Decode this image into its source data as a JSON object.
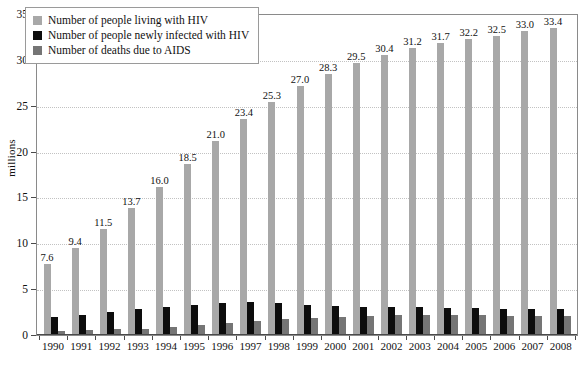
{
  "chart_data": {
    "type": "bar",
    "title": "",
    "subtitle": "",
    "xlabel": "",
    "ylabel": "millions",
    "ylim": [
      0,
      35
    ],
    "ytick_step": 5,
    "yticks": [
      "0",
      "5",
      "10",
      "15",
      "20",
      "25",
      "30",
      "35"
    ],
    "grid": true,
    "legend_position": "top-left-inside",
    "categories": [
      "1990",
      "1991",
      "1992",
      "1993",
      "1994",
      "1995",
      "1996",
      "1997",
      "1998",
      "1999",
      "2000",
      "2001",
      "2002",
      "2003",
      "2004",
      "2005",
      "2006",
      "2007",
      "2008"
    ],
    "series": [
      {
        "name": "Number of people living with HIV",
        "color": "#a8a8a8",
        "show_labels": true,
        "values": [
          7.6,
          9.4,
          11.5,
          13.7,
          16.0,
          18.5,
          21.0,
          23.4,
          25.3,
          27.0,
          28.3,
          29.5,
          30.4,
          31.2,
          31.7,
          32.2,
          32.5,
          33.0,
          33.4
        ],
        "labels": [
          "7.6",
          "9.4",
          "11.5",
          "13.7",
          "16.0",
          "18.5",
          "21.0",
          "23.4",
          "25.3",
          "27.0",
          "28.3",
          "29.5",
          "30.4",
          "31.2",
          "31.7",
          "32.2",
          "32.5",
          "33.0",
          "33.4"
        ]
      },
      {
        "name": "Number of people newly infected with HIV",
        "color": "#0d0d0d",
        "show_labels": false,
        "values": [
          1.9,
          2.1,
          2.4,
          2.7,
          3.0,
          3.2,
          3.4,
          3.5,
          3.4,
          3.2,
          3.1,
          3.0,
          2.9,
          2.9,
          2.8,
          2.8,
          2.7,
          2.7,
          2.7
        ],
        "labels": []
      },
      {
        "name": "Number of deaths due to AIDS",
        "color": "#757575",
        "show_labels": false,
        "values": [
          0.3,
          0.4,
          0.5,
          0.6,
          0.8,
          1.0,
          1.2,
          1.4,
          1.6,
          1.8,
          1.9,
          2.0,
          2.1,
          2.1,
          2.1,
          2.1,
          2.0,
          2.0,
          2.0
        ],
        "labels": []
      }
    ]
  },
  "legend": {
    "items": [
      {
        "label": "Number of people living with HIV",
        "color": "#a8a8a8"
      },
      {
        "label": "Number of people newly infected with HIV",
        "color": "#0d0d0d"
      },
      {
        "label": "Number of deaths due to AIDS",
        "color": "#757575"
      }
    ]
  },
  "axis": {
    "y_title": "millions"
  }
}
